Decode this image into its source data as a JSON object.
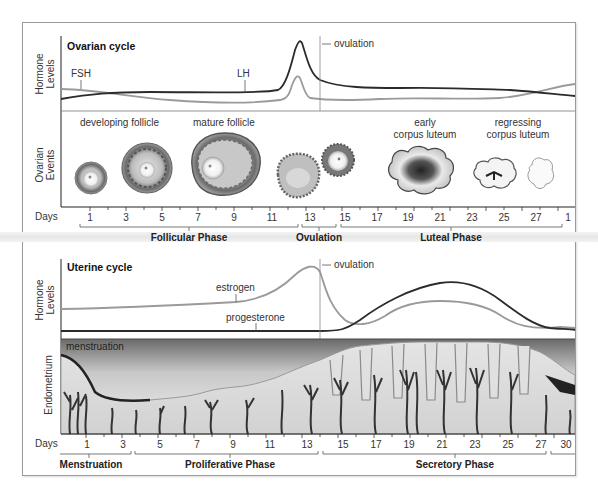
{
  "ovarian": {
    "title": "Ovarian cycle",
    "y_label_hormone": [
      "Hormone",
      "Levels"
    ],
    "y_label_events": [
      "Ovarian",
      "Events"
    ],
    "hormones": {
      "fsh": "FSH",
      "lh": "LH"
    },
    "ovulation_label": "ovulation",
    "events": {
      "developing": "developing follicle",
      "mature": "mature follicle",
      "early_cl": [
        "early",
        "corpus luteum"
      ],
      "regressing_cl": [
        "regressing",
        "corpus luteum"
      ]
    },
    "days_label": "Days",
    "days": [
      "1",
      "3",
      "5",
      "7",
      "9",
      "11",
      "13",
      "15",
      "17",
      "19",
      "21",
      "23",
      "25",
      "27",
      "1"
    ],
    "phases": [
      "Follicular Phase",
      "Ovulation",
      "Luteal Phase"
    ]
  },
  "uterine": {
    "title": "Uterine cycle",
    "y_label_hormone": [
      "Hormone",
      "Levels"
    ],
    "y_label_endo": "Endometrium",
    "hormones": {
      "estrogen": "estrogen",
      "progesterone": "progesterone"
    },
    "ovulation_label": "ovulation",
    "menstruation_label": "menstruation",
    "days_label": "Days",
    "days": [
      "1",
      "3",
      "5",
      "7",
      "9",
      "11",
      "13",
      "15",
      "17",
      "19",
      "21",
      "23",
      "25",
      "27",
      "30"
    ],
    "phases": [
      "Menstruation",
      "Proliferative Phase",
      "Secretory Phase"
    ]
  },
  "colors": {
    "dark_line": "#2b2b2b",
    "light_line": "#9a9a9a",
    "frame": "#9a9a9a"
  }
}
